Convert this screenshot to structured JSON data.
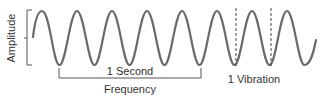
{
  "diagram": {
    "labels": {
      "amplitude": "Amplitude",
      "one_second": "1 Second",
      "frequency": "Frequency",
      "one_vibration": "1 Vibration"
    },
    "wave": {
      "cycles_shown": 8,
      "cycles_per_second_bracket": 4,
      "color": "#666666"
    },
    "colors": {
      "line": "#666666",
      "text": "#333333",
      "background": "#ffffff"
    }
  }
}
